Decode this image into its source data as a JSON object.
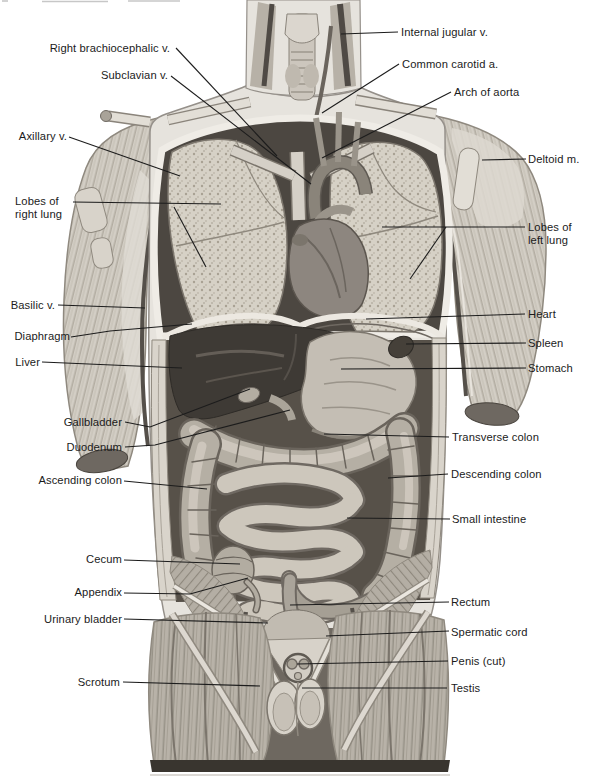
{
  "figure": {
    "kind": "anatomical illustration",
    "view": "human torso, anterior view, internal organs exposed"
  },
  "style": {
    "ink": "#1c1c1c",
    "paper": "#ffffff"
  },
  "labels": {
    "internal_jugular": "Internal jugular v.",
    "common_carotid": "Common carotid a.",
    "arch_of_aorta": "Arch of aorta",
    "right_brachiocephalic": "Right brachiocephalic v.",
    "subclavian": "Subclavian v.",
    "axillary": "Axillary v.",
    "deltoid": "Deltoid m.",
    "lobes_right_lung": "Lobes of\nright lung",
    "lobes_left_lung": "Lobes of\nleft lung",
    "basilic": "Basilic v.",
    "heart": "Heart",
    "diaphragm": "Diaphragm",
    "spleen": "Spleen",
    "liver": "Liver",
    "stomach": "Stomach",
    "gallbladder": "Gallbladder",
    "transverse_colon": "Transverse colon",
    "duodenum": "Duodenum",
    "descending_colon": "Descending colon",
    "ascending_colon": "Ascending colon",
    "small_intestine": "Small intestine",
    "cecum": "Cecum",
    "appendix": "Appendix",
    "urinary_bladder": "Urinary bladder",
    "rectum": "Rectum",
    "spermatic_cord": "Spermatic cord",
    "penis_cut": "Penis (cut)",
    "scrotum": "Scrotum",
    "testis": "Testis"
  }
}
